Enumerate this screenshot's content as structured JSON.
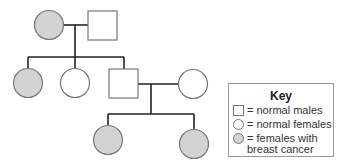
{
  "diagram": {
    "type": "pedigree",
    "colors": {
      "line": "#222222",
      "outline": "#777777",
      "affected_fill": "#d3d3d3",
      "unaffected_fill": "#ffffff"
    },
    "generations": [
      {
        "label": "I",
        "individuals": [
          {
            "id": "I-1",
            "sex": "female",
            "affected": true
          },
          {
            "id": "I-2",
            "sex": "male",
            "affected": false
          }
        ]
      },
      {
        "label": "II",
        "individuals": [
          {
            "id": "II-1",
            "sex": "female",
            "affected": true
          },
          {
            "id": "II-2",
            "sex": "female",
            "affected": false
          },
          {
            "id": "II-3",
            "sex": "male",
            "affected": false
          },
          {
            "id": "II-4",
            "sex": "female",
            "affected": false
          }
        ]
      },
      {
        "label": "III",
        "individuals": [
          {
            "id": "III-1",
            "sex": "female",
            "affected": true
          },
          {
            "id": "III-2",
            "sex": "female",
            "affected": true
          }
        ]
      }
    ]
  },
  "key": {
    "title": "Key",
    "items": [
      {
        "symbol": "square-icon",
        "label": "= normal males"
      },
      {
        "symbol": "circle-icon",
        "label": "= normal females"
      },
      {
        "symbol": "shaded-circle-icon",
        "label": "= females with",
        "label_line2": "breast cancer"
      }
    ]
  }
}
